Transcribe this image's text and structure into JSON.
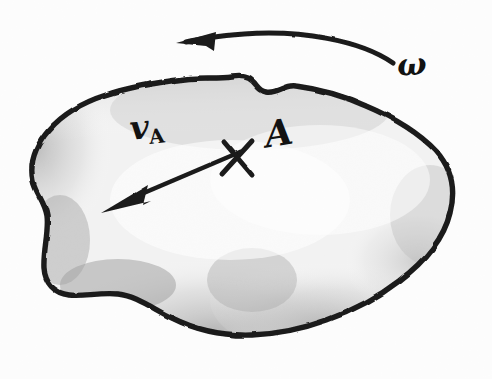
{
  "figure": {
    "background_color": "#fdfdfd",
    "ink_color": "#141414",
    "shading_color": "#b9b9b9"
  },
  "labels": {
    "velocity_symbol": "v",
    "velocity_subscript": "A",
    "point_label": "A",
    "angular_velocity": "ω",
    "point_marker": "×"
  },
  "annotations": {
    "body": {
      "name": "rigid-body-blob",
      "fill": "#efefef",
      "stroke": "#141414",
      "stroke_width": 5
    },
    "velocity_vector": {
      "name": "velocity-vector-arrow",
      "tail_x": 238,
      "tail_y": 155,
      "tip_x": 104,
      "tip_y": 212,
      "direction": "down-left"
    },
    "rotation_arrow": {
      "name": "angular-velocity-arc",
      "start_x": 392,
      "start_y": 62,
      "end_x": 182,
      "end_y": 42,
      "direction": "counterclockwise",
      "arrowhead": "left"
    },
    "point_marker": {
      "name": "point-a-marker",
      "x": 238,
      "y": 157
    }
  }
}
